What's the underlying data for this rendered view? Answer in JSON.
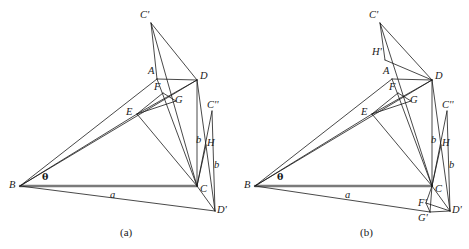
{
  "figure": {
    "background_color": "#ffffff",
    "line_color": "#1a1a1a",
    "thick_line_color": "#7a7a7a",
    "label_color": "#1a1a1a",
    "width": 469,
    "height": 249
  },
  "captions": [
    {
      "text": "(a)",
      "x": 120,
      "y": 227
    },
    {
      "text": "(b)",
      "x": 360,
      "y": 227
    }
  ],
  "panel_a": {
    "name": "(a)",
    "points": {
      "Cp": {
        "label": "C'",
        "x": 151,
        "y": 23
      },
      "A": {
        "label": "A",
        "x": 157,
        "y": 79
      },
      "D": {
        "label": "D",
        "x": 197,
        "y": 80
      },
      "F": {
        "label": "F",
        "x": 163,
        "y": 93
      },
      "G": {
        "label": "G",
        "x": 176,
        "y": 101
      },
      "E": {
        "label": "E",
        "x": 137,
        "y": 114
      },
      "Cpp": {
        "label": "C''",
        "x": 212,
        "y": 111
      },
      "H": {
        "label": "H",
        "x": 206,
        "y": 145
      },
      "B": {
        "label": "B",
        "x": 20,
        "y": 186
      },
      "C": {
        "label": "C",
        "x": 197,
        "y": 186
      },
      "Dp": {
        "label": "D'",
        "x": 215,
        "y": 211
      }
    },
    "labels": [
      {
        "name": "label-Cprime",
        "text": "C'",
        "x": 140,
        "y": 10
      },
      {
        "name": "label-A",
        "text": "A",
        "x": 148,
        "y": 66
      },
      {
        "name": "label-D",
        "text": "D",
        "x": 200,
        "y": 71
      },
      {
        "name": "label-F",
        "text": "F",
        "x": 154,
        "y": 82
      },
      {
        "name": "label-G",
        "text": "G",
        "x": 175,
        "y": 95
      },
      {
        "name": "label-E",
        "text": "E",
        "x": 126,
        "y": 107
      },
      {
        "name": "label-Cdprime",
        "text": "C''",
        "x": 207,
        "y": 100
      },
      {
        "name": "label-b-upper",
        "text": "b",
        "x": 196,
        "y": 135
      },
      {
        "name": "label-H",
        "text": "H",
        "x": 207,
        "y": 138
      },
      {
        "name": "label-b-lower",
        "text": "b",
        "x": 214,
        "y": 160
      },
      {
        "name": "label-theta",
        "text": "θ",
        "x": 42,
        "y": 172
      },
      {
        "name": "label-B",
        "text": "B",
        "x": 9,
        "y": 180
      },
      {
        "name": "label-a",
        "text": "a",
        "x": 110,
        "y": 190
      },
      {
        "name": "label-C",
        "text": "C",
        "x": 200,
        "y": 184
      },
      {
        "name": "label-Dprime",
        "text": "D'",
        "x": 217,
        "y": 205
      }
    ],
    "segments": [
      {
        "name": "seg-B-C-base",
        "from": "B",
        "to": "C",
        "style": "thick"
      },
      {
        "name": "seg-B-A",
        "from": "B",
        "to": "A",
        "style": "thin"
      },
      {
        "name": "seg-B-D",
        "from": "B",
        "to": "D",
        "style": "thin"
      },
      {
        "name": "seg-B-E",
        "from": "B",
        "to": "E",
        "style": "thin"
      },
      {
        "name": "seg-B-Dp",
        "from": "B",
        "to": "Dp",
        "style": "thin"
      },
      {
        "name": "seg-A-D",
        "from": "A",
        "to": "D",
        "style": "thin"
      },
      {
        "name": "seg-A-C",
        "from": "A",
        "to": "C",
        "style": "thin"
      },
      {
        "name": "seg-Cp-A",
        "from": "Cp",
        "to": "A",
        "style": "thin"
      },
      {
        "name": "seg-Cp-C",
        "from": "Cp",
        "to": "C",
        "style": "thin"
      },
      {
        "name": "seg-Cp-D",
        "from": "Cp",
        "to": "D",
        "style": "thin"
      },
      {
        "name": "seg-D-C",
        "from": "D",
        "to": "C",
        "style": "thin"
      },
      {
        "name": "seg-D-E",
        "from": "D",
        "to": "E",
        "style": "thin"
      },
      {
        "name": "seg-D-Dp",
        "from": "D",
        "to": "Dp",
        "style": "thin"
      },
      {
        "name": "seg-E-F",
        "from": "E",
        "to": "F",
        "style": "thin"
      },
      {
        "name": "seg-E-G",
        "from": "E",
        "to": "G",
        "style": "thin"
      },
      {
        "name": "seg-E-C",
        "from": "E",
        "to": "C",
        "style": "thin"
      },
      {
        "name": "seg-F-G",
        "from": "F",
        "to": "G",
        "style": "thin"
      },
      {
        "name": "seg-C-Cpp",
        "from": "C",
        "to": "Cpp",
        "style": "thin"
      },
      {
        "name": "seg-C-H",
        "from": "C",
        "to": "H",
        "style": "thin"
      },
      {
        "name": "seg-C-Dp",
        "from": "C",
        "to": "Dp",
        "style": "thin"
      },
      {
        "name": "seg-Cpp-Dp",
        "from": "Cpp",
        "to": "Dp",
        "style": "thin"
      }
    ]
  },
  "panel_b": {
    "name": "(b)",
    "points": {
      "Cp": {
        "label": "C'",
        "x": 380,
        "y": 23
      },
      "Hp": {
        "label": "H'",
        "x": 385,
        "y": 60
      },
      "A": {
        "label": "A",
        "x": 392,
        "y": 79
      },
      "D": {
        "label": "D",
        "x": 432,
        "y": 80
      },
      "F": {
        "label": "F",
        "x": 398,
        "y": 93
      },
      "G": {
        "label": "G",
        "x": 411,
        "y": 101
      },
      "E": {
        "label": "E",
        "x": 372,
        "y": 114
      },
      "Cpp": {
        "label": "C''",
        "x": 447,
        "y": 111
      },
      "H": {
        "label": "H",
        "x": 441,
        "y": 145
      },
      "B": {
        "label": "B",
        "x": 255,
        "y": 186
      },
      "C": {
        "label": "C",
        "x": 432,
        "y": 186
      },
      "Fp": {
        "label": "F'",
        "x": 426,
        "y": 203
      },
      "Gp": {
        "label": "G'",
        "x": 430,
        "y": 212
      },
      "Dp": {
        "label": "D'",
        "x": 450,
        "y": 211
      }
    },
    "labels": [
      {
        "name": "label-Cprime",
        "text": "C'",
        "x": 369,
        "y": 10
      },
      {
        "name": "label-Hprime",
        "text": "H'",
        "x": 372,
        "y": 47
      },
      {
        "name": "label-A",
        "text": "A",
        "x": 383,
        "y": 66
      },
      {
        "name": "label-D",
        "text": "D",
        "x": 435,
        "y": 71
      },
      {
        "name": "label-F",
        "text": "F",
        "x": 389,
        "y": 82
      },
      {
        "name": "label-G",
        "text": "G",
        "x": 410,
        "y": 95
      },
      {
        "name": "label-E",
        "text": "E",
        "x": 361,
        "y": 107
      },
      {
        "name": "label-Cdprime",
        "text": "C''",
        "x": 442,
        "y": 100
      },
      {
        "name": "label-b-upper",
        "text": "b",
        "x": 431,
        "y": 135
      },
      {
        "name": "label-H",
        "text": "H",
        "x": 442,
        "y": 138
      },
      {
        "name": "label-b-lower",
        "text": "b",
        "x": 449,
        "y": 160
      },
      {
        "name": "label-theta",
        "text": "θ",
        "x": 277,
        "y": 172
      },
      {
        "name": "label-B",
        "text": "B",
        "x": 244,
        "y": 180
      },
      {
        "name": "label-a",
        "text": "a",
        "x": 345,
        "y": 190
      },
      {
        "name": "label-C",
        "text": "C",
        "x": 435,
        "y": 184
      },
      {
        "name": "label-Fprime",
        "text": "F'",
        "x": 418,
        "y": 198
      },
      {
        "name": "label-Gprime",
        "text": "G'",
        "x": 418,
        "y": 213
      },
      {
        "name": "label-Dprime",
        "text": "D'",
        "x": 452,
        "y": 205
      }
    ],
    "segments": [
      {
        "name": "seg-B-C-base",
        "from": "B",
        "to": "C",
        "style": "thick"
      },
      {
        "name": "seg-B-A",
        "from": "B",
        "to": "A",
        "style": "thin"
      },
      {
        "name": "seg-B-D",
        "from": "B",
        "to": "D",
        "style": "thin"
      },
      {
        "name": "seg-B-E",
        "from": "B",
        "to": "E",
        "style": "thin"
      },
      {
        "name": "seg-B-Gp",
        "from": "B",
        "to": "Gp",
        "style": "thin"
      },
      {
        "name": "seg-A-D",
        "from": "A",
        "to": "D",
        "style": "thin"
      },
      {
        "name": "seg-A-C",
        "from": "A",
        "to": "C",
        "style": "thin"
      },
      {
        "name": "seg-Cp-Hp",
        "from": "Cp",
        "to": "Hp",
        "style": "thin"
      },
      {
        "name": "seg-Cp-C",
        "from": "Cp",
        "to": "C",
        "style": "thin"
      },
      {
        "name": "seg-Cp-D",
        "from": "Cp",
        "to": "D",
        "style": "thin"
      },
      {
        "name": "seg-Hp-D",
        "from": "Hp",
        "to": "D",
        "style": "thin"
      },
      {
        "name": "seg-D-C",
        "from": "D",
        "to": "C",
        "style": "thin"
      },
      {
        "name": "seg-D-E",
        "from": "D",
        "to": "E",
        "style": "thin"
      },
      {
        "name": "seg-D-Dp",
        "from": "D",
        "to": "Dp",
        "style": "thin"
      },
      {
        "name": "seg-E-F",
        "from": "E",
        "to": "F",
        "style": "thin"
      },
      {
        "name": "seg-E-G",
        "from": "E",
        "to": "G",
        "style": "thin"
      },
      {
        "name": "seg-E-C",
        "from": "E",
        "to": "C",
        "style": "thin"
      },
      {
        "name": "seg-F-G",
        "from": "F",
        "to": "G",
        "style": "thin"
      },
      {
        "name": "seg-C-Cpp",
        "from": "C",
        "to": "Cpp",
        "style": "thin"
      },
      {
        "name": "seg-C-H",
        "from": "C",
        "to": "H",
        "style": "thin"
      },
      {
        "name": "seg-C-Fp",
        "from": "C",
        "to": "Fp",
        "style": "thin"
      },
      {
        "name": "seg-C-Gp",
        "from": "C",
        "to": "Gp",
        "style": "thin"
      },
      {
        "name": "seg-C-Dp",
        "from": "C",
        "to": "Dp",
        "style": "thin"
      },
      {
        "name": "seg-Fp-Gp",
        "from": "Fp",
        "to": "Gp",
        "style": "thin"
      },
      {
        "name": "seg-Fp-Dp",
        "from": "Fp",
        "to": "Dp",
        "style": "thin"
      },
      {
        "name": "seg-Gp-Dp",
        "from": "Gp",
        "to": "Dp",
        "style": "thin"
      },
      {
        "name": "seg-Cpp-Dp",
        "from": "Cpp",
        "to": "Dp",
        "style": "thin"
      }
    ]
  }
}
